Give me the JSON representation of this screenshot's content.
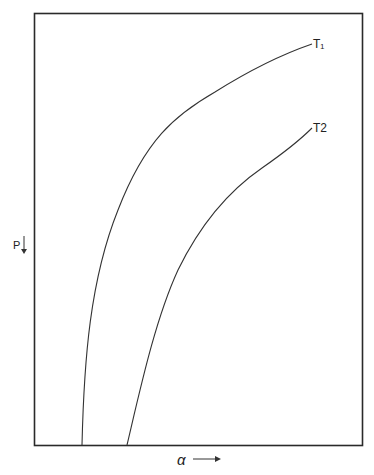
{
  "figure": {
    "y_axis_label": "P",
    "x_axis_label": "α",
    "curves": [
      {
        "name": "T1",
        "label": "T₁"
      },
      {
        "name": "T2",
        "label": "T2"
      }
    ],
    "colors": {
      "line": "#333333",
      "frame": "#2a2a2a",
      "background": "#ffffff"
    }
  }
}
